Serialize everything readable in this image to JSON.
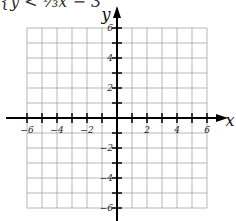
{
  "header": {
    "text": "{y < ⅓x − 3"
  },
  "graph": {
    "x_axis_label": "x",
    "y_axis_label": "y",
    "x_range": [
      -6,
      6
    ],
    "y_range": [
      -6,
      6
    ],
    "x_tick_labels": [
      "-6",
      "-4",
      "-2",
      "2",
      "4",
      "6"
    ],
    "y_tick_labels": [
      "6",
      "4",
      "2",
      "-2",
      "-4",
      "-6"
    ],
    "grid": true
  }
}
